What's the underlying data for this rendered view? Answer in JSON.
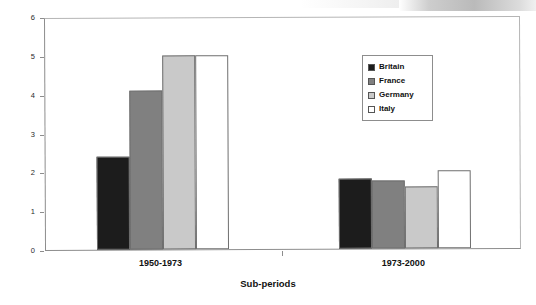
{
  "chart_data": {
    "type": "bar",
    "title": "",
    "xlabel": "Sub-periods",
    "ylabel": "Growth of GDP per capita",
    "categories": [
      "1950-1973",
      "1973-2000"
    ],
    "ylim": [
      0,
      6
    ],
    "yticks": [
      0,
      1,
      2,
      3,
      4,
      5,
      6
    ],
    "ytick_labels": [
      "0",
      "1",
      "2",
      "3",
      "4",
      "5",
      "6"
    ],
    "grid": false,
    "legend_position": "upper right",
    "series": [
      {
        "name": "Britain",
        "color": "#1c1c1c",
        "values": [
          2.4,
          1.8
        ]
      },
      {
        "name": "France",
        "color": "#808080",
        "values": [
          4.1,
          1.75
        ]
      },
      {
        "name": "Germany",
        "color": "#c9c9c9",
        "values": [
          5.0,
          1.6
        ]
      },
      {
        "name": "Italy",
        "color": "#ffffff",
        "values": [
          5.0,
          2.0
        ]
      }
    ]
  }
}
